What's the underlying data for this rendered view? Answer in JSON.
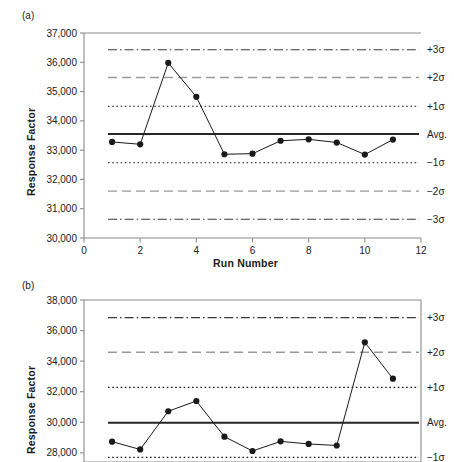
{
  "figure": {
    "panels": [
      {
        "key": "a",
        "label": "(a)",
        "ylabel": "Response Factor",
        "xlabel": "Run Number"
      },
      {
        "key": "b",
        "label": "(b)",
        "ylabel": "Response Factor",
        "xlabel": ""
      }
    ],
    "limit_labels": {
      "plus3": "+3σ",
      "plus2": "+2σ",
      "plus1": "+1σ",
      "avg": "Avg.",
      "minus1": "−1σ",
      "minus2": "−2σ",
      "minus3": "−3σ"
    },
    "colors": {
      "axis": "#8c8c8c",
      "series": "#1a1a1a",
      "avg_line": "#262626",
      "sigma1": "#1a1a1a",
      "sigma2": "#9a9a9a",
      "sigma3": "#3a3a3a",
      "text": "#1a1a1a"
    }
  },
  "chart_data": [
    {
      "type": "line",
      "panel": "(a)",
      "title": "",
      "xlabel": "Run Number",
      "ylabel": "Response Factor",
      "xlim": [
        0,
        12
      ],
      "ylim": [
        30000,
        37000
      ],
      "xticks": [
        0,
        2,
        4,
        6,
        8,
        10,
        12
      ],
      "xtick_labels": [
        "0",
        "2",
        "4",
        "6",
        "8",
        "10",
        "12"
      ],
      "yticks": [
        30000,
        31000,
        32000,
        33000,
        34000,
        35000,
        36000,
        37000
      ],
      "ytick_labels": [
        "30,000",
        "31,000",
        "32,000",
        "33,000",
        "34,000",
        "35,000",
        "36,000",
        "37,000"
      ],
      "grid": false,
      "legend": "none",
      "x": [
        1,
        2,
        3,
        4,
        5,
        6,
        7,
        8,
        9,
        10,
        11
      ],
      "values": [
        33280,
        33200,
        35980,
        34820,
        32860,
        32880,
        33320,
        33370,
        33260,
        32850,
        33360
      ],
      "control_limits": {
        "avg": 33550,
        "plus1": 34500,
        "plus2": 35480,
        "plus3": 36430,
        "minus1": 32570,
        "minus2": 31600,
        "minus3": 30640
      },
      "annotations": [
        "+3σ",
        "+2σ",
        "+1σ",
        "Avg.",
        "−1σ",
        "−2σ",
        "−3σ"
      ]
    },
    {
      "type": "line",
      "panel": "(b)",
      "title": "",
      "xlabel": "",
      "ylabel": "Response Factor",
      "xlim": [
        0,
        12
      ],
      "ylim": [
        27400,
        38000
      ],
      "xticks": [],
      "xtick_labels": [],
      "yticks": [
        28000,
        30000,
        32000,
        34000,
        36000,
        38000
      ],
      "ytick_labels": [
        "28,000",
        "30,000",
        "32,000",
        "34,000",
        "36,000",
        "38,000"
      ],
      "grid": false,
      "legend": "none",
      "x": [
        1,
        2,
        3,
        4,
        5,
        6,
        7,
        8,
        9,
        10,
        11
      ],
      "values": [
        28730,
        28220,
        30720,
        31390,
        29060,
        28120,
        28750,
        28580,
        28480,
        35230,
        32850
      ],
      "control_limits": {
        "avg": 29970,
        "plus1": 32280,
        "plus2": 34580,
        "plus3": 36850,
        "minus1": 27700
      },
      "annotations": [
        "+3σ",
        "+2σ",
        "+1σ",
        "Avg.",
        "−1σ"
      ]
    }
  ]
}
